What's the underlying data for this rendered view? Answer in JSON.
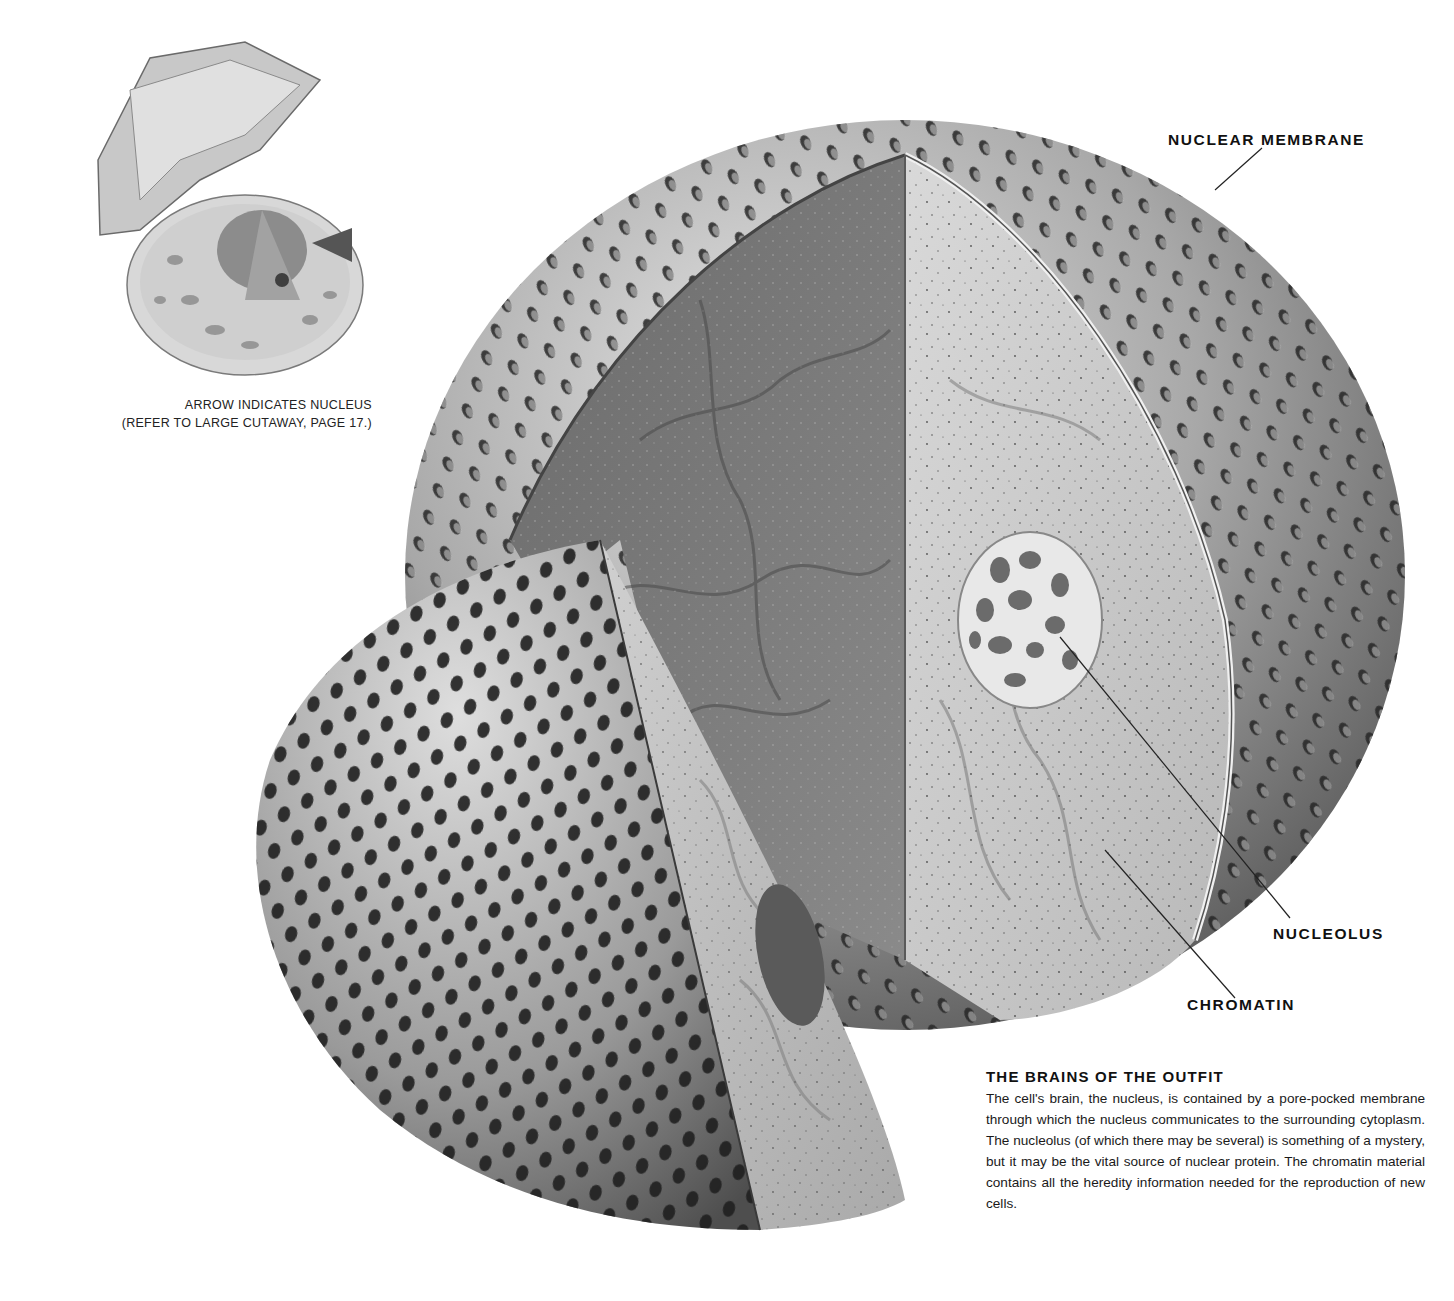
{
  "thumbnail": {
    "caption_line1": "ARROW INDICATES NUCLEUS",
    "caption_line2": "(REFER TO LARGE CUTAWAY, PAGE 17.)"
  },
  "labels": {
    "nuclear_membrane": "NUCLEAR MEMBRANE",
    "nucleolus": "NUCLEOLUS",
    "chromatin": "CHROMATIN"
  },
  "article": {
    "title": "THE BRAINS OF THE OUTFIT",
    "body": "The cell's brain, the nucleus, is contained by a pore-pocked membrane through which the nucleus communicates to the surrounding cytoplasm. The nucleolus (of which there may be several) is something of a mystery, but it may be the vital source of nuclear protein. The chromatin material contains all the heredity information needed for the reproduction of new cells."
  },
  "colors": {
    "background": "#ffffff",
    "text": "#1a1a1a",
    "membrane_light": "#d8d8d8",
    "membrane_dark": "#6e6e6e",
    "cut_face_dark": "#7a7a7a",
    "cut_face_light": "#d4d4d4"
  }
}
